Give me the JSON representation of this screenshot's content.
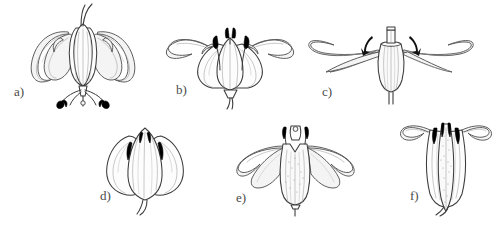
{
  "figure": {
    "background_color": "#ffffff",
    "line_color": "#3c3c3c",
    "anther_color": "#000000",
    "width": 493,
    "height": 228
  },
  "panels": [
    {
      "id": "a",
      "label": "a)",
      "description": "Turk's-cap flower with strongly reflexed recurved tepals, long exserted style and spreading stamens with dark anthers pointing downward",
      "label_x": 14,
      "label_y": 84
    },
    {
      "id": "b",
      "label": "b)",
      "description": "Open bowl-shaped flower with outward-curving tepal tips, erect central stamens with dark anthers",
      "label_x": 176,
      "label_y": 84
    },
    {
      "id": "c",
      "label": "c)",
      "description": "Flower with horizontally spreading narrow tepals, short tube, small anthers and curved motion arrows at the throat",
      "label_x": 322,
      "label_y": 87
    },
    {
      "id": "d",
      "label": "d)",
      "description": "Closed campanulate bud-like flower, tepals overlapping with small dark anther tips showing between them",
      "label_x": 100,
      "label_y": 196
    },
    {
      "id": "e",
      "label": "e)",
      "description": "Funnel-form flower with recurved tepal tips, stippled inner tube and exserted stamens",
      "label_x": 236,
      "label_y": 196
    },
    {
      "id": "f",
      "label": "f)",
      "description": "Narrow tubular flower with short reflexed lobes, dark anthers at the mouth and stippled tube interior",
      "label_x": 410,
      "label_y": 194
    }
  ]
}
